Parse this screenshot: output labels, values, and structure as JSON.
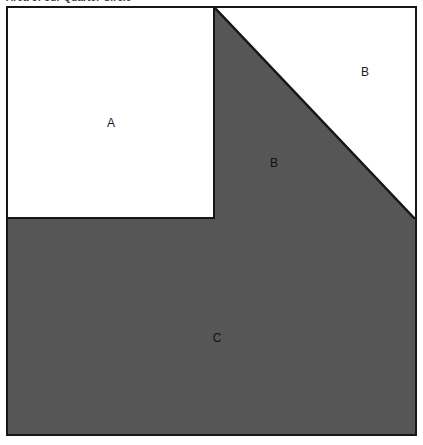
{
  "heading": {
    "text": "Area of our Quarter Circle"
  },
  "figure": {
    "colors": {
      "shaded": "#565656",
      "unshaded": "#ffffff",
      "stroke": "#161616"
    },
    "regions": [
      {
        "id": "A",
        "label": "A",
        "shape": "square",
        "fill": "unshaded",
        "position": "upper-left"
      },
      {
        "id": "B_upper",
        "label": "B",
        "shape": "right-triangle",
        "fill": "unshaded",
        "position": "upper-right-above-hypotenuse"
      },
      {
        "id": "B_lower",
        "label": "B",
        "shape": "right-triangle",
        "fill": "shaded",
        "position": "upper-right-below-hypotenuse"
      },
      {
        "id": "C",
        "label": "C",
        "shape": "rectangle",
        "fill": "shaded",
        "position": "lower-full-width"
      }
    ]
  },
  "labels": {
    "a": "A",
    "b_upper": "B",
    "b_lower": "B",
    "c": "C"
  }
}
